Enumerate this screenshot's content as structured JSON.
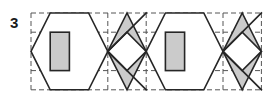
{
  "figure": {
    "label": "3",
    "caption_number": "3",
    "type": "geometric-frieze-pattern"
  },
  "colors": {
    "stroke": "#262626",
    "grid": "#555555",
    "fill_shaded": "#cbcbcb",
    "fill_empty": "#ffffff",
    "background": "#ffffff",
    "label": "#1a1a1a"
  },
  "grid": {
    "visible": true,
    "style": "dashed",
    "origin_x": 31,
    "origin_y": 13,
    "cell_width": 19.2,
    "cell_height": 19.2,
    "columns": 12,
    "rows": 4,
    "x_lines": [
      31,
      50.2,
      69.4,
      88.6,
      107.8,
      127,
      146.2,
      165.4,
      184.6,
      203.8,
      223,
      242.2,
      261.4
    ],
    "y_lines": [
      13,
      32.2,
      51.4,
      70.6,
      89.8
    ],
    "dash_pattern": "5,3",
    "stroke_width": 1
  },
  "motifs": [
    {
      "index": 1,
      "name": "hexagon-with-rectangle",
      "outer_shape": "hexagon",
      "outer_points": "31,51.4 50.2,13 88.6,13 107.8,51.4 88.6,89.8 50.2,89.8",
      "outer_fill": "#ffffff",
      "inner_shape": "rectangle",
      "inner_x": 50.2,
      "inner_y": 32.2,
      "inner_width": 19.2,
      "inner_height": 38.4,
      "inner_fill": "#cbcbcb"
    },
    {
      "index": 2,
      "name": "rhombus-with-inner-rhombus",
      "outer_shape": "rhombus",
      "outer_points": "107.8,51.4 127,13 146.2,51.4 127,89.8",
      "outer_fill": "#cbcbcb",
      "inner_shape": "rhombus",
      "inner_points": "107.8,51.4 127,32.2 146.2,51.4 127,70.6",
      "inner_fill": "#ffffff"
    },
    {
      "index": 3,
      "name": "hexagon-with-rectangle",
      "outer_shape": "hexagon",
      "outer_points": "146.2,51.4 165.4,13 203.8,13 223,51.4 203.8,89.8 165.4,89.8",
      "outer_fill": "#ffffff",
      "inner_shape": "rectangle",
      "inner_x": 165.4,
      "inner_y": 32.2,
      "inner_width": 19.2,
      "inner_height": 38.4,
      "inner_fill": "#cbcbcb"
    },
    {
      "index": 4,
      "name": "rhombus-with-inner-rhombus",
      "outer_shape": "rhombus",
      "outer_points": "223,51.4 242.2,13 261.4,51.4 242.2,89.8",
      "outer_fill": "#cbcbcb",
      "inner_shape": "rhombus",
      "inner_points": "223,51.4 242.2,32.2 261.4,51.4 242.2,70.6",
      "inner_fill": "#ffffff"
    }
  ],
  "connector_lines": [
    {
      "name": "zigzag-up-right-1",
      "x1": 107.8,
      "y1": 51.4,
      "x2": 146.2,
      "y2": 13
    },
    {
      "name": "zigzag-down-right-1",
      "x1": 107.8,
      "y1": 51.4,
      "x2": 146.2,
      "y2": 89.8
    },
    {
      "name": "zigzag-up-right-2",
      "x1": 223,
      "y1": 51.4,
      "x2": 261.4,
      "y2": 13
    },
    {
      "name": "zigzag-down-right-2",
      "x1": 223,
      "y1": 51.4,
      "x2": 261.4,
      "y2": 89.8
    }
  ]
}
